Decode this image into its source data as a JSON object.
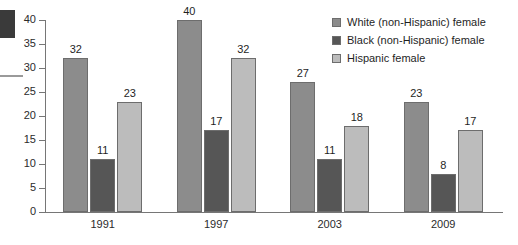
{
  "chart_data": {
    "type": "bar",
    "title": "",
    "xlabel": "",
    "ylabel": "",
    "ylim": [
      0,
      40
    ],
    "yticks": [
      0,
      5,
      10,
      15,
      20,
      25,
      30,
      35,
      40
    ],
    "grid": false,
    "legend_position": "top-right",
    "categories": [
      "1991",
      "1997",
      "2003",
      "2009"
    ],
    "series": [
      {
        "name": "White (non-Hispanic) female",
        "color": "#8c8c8c",
        "values": [
          32,
          40,
          27,
          23
        ]
      },
      {
        "name": "Black (non-Hispanic) female",
        "color": "#565656",
        "values": [
          11,
          17,
          11,
          8
        ]
      },
      {
        "name": "Hispanic female",
        "color": "#bcbcbc",
        "values": [
          23,
          32,
          18,
          17
        ]
      }
    ]
  },
  "axis": {
    "y_tick_labels": [
      "40",
      "35",
      "30",
      "25",
      "20",
      "15",
      "10",
      "5",
      "0"
    ]
  },
  "legend": {
    "items": [
      {
        "label": "White (non-Hispanic) female",
        "color": "#8c8c8c"
      },
      {
        "label": "Black (non-Hispanic) female",
        "color": "#565656"
      },
      {
        "label": "Hispanic female",
        "color": "#bcbcbc"
      }
    ]
  },
  "colors": {
    "axis": "#767676",
    "bar_border": "#6d6d6d",
    "text": "#1f1f1f",
    "artifact": "#3a3a3a"
  }
}
